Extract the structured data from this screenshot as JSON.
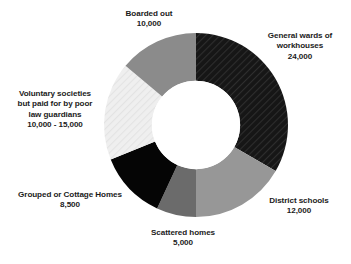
{
  "chart_data": {
    "type": "pie",
    "variant": "donut",
    "title": "",
    "subtitle": "",
    "xlabel": "",
    "ylabel": "",
    "grid": false,
    "legend": "none",
    "labels_position": "outside-callout-text",
    "start_angle_deg": 0,
    "direction": "clockwise",
    "inner_radius_ratio": 0.48,
    "total": 72000,
    "categories": [
      "General wards of workhouses",
      "District schools",
      "Scattered homes",
      "Grouped or Cottage Homes",
      "Voluntary societies but paid for by poor law guardians",
      "Boarded out"
    ],
    "values": [
      24000,
      12000,
      5000,
      8500,
      12500,
      10000
    ],
    "value_labels": [
      "24,000",
      "12,000",
      "5,000",
      "8,500",
      "10,000 - 15,000",
      "10,000"
    ],
    "slices": [
      {
        "name": "General wards of workhouses",
        "value": 24000,
        "value_label": "24,000",
        "angle_deg": 120,
        "start_deg": 0,
        "end_deg": 120,
        "fill": "#1c1c1c",
        "pattern": "diagonal-hatch-dark"
      },
      {
        "name": "District schools",
        "value": 12000,
        "value_label": "12,000",
        "angle_deg": 60,
        "start_deg": 120,
        "end_deg": 180,
        "fill": "#979797",
        "pattern": "solid"
      },
      {
        "name": "Scattered homes",
        "value": 5000,
        "value_label": "5,000",
        "angle_deg": 25,
        "start_deg": 180,
        "end_deg": 205,
        "fill": "#6b6b6b",
        "pattern": "solid"
      },
      {
        "name": "Grouped or Cottage Homes",
        "value": 8500,
        "value_label": "8,500",
        "angle_deg": 43,
        "start_deg": 205,
        "end_deg": 248,
        "fill": "#050505",
        "pattern": "solid"
      },
      {
        "name": "Voluntary societies but paid for by poor law guardians",
        "value": 12500,
        "value_label": "10,000 - 15,000",
        "angle_deg": 62,
        "start_deg": 248,
        "end_deg": 310,
        "fill": "#ededed",
        "pattern": "diagonal-hatch-light"
      },
      {
        "name": "Boarded out",
        "value": 10000,
        "value_label": "10,000",
        "angle_deg": 50,
        "start_deg": 310,
        "end_deg": 360,
        "fill": "#8b8b8b",
        "pattern": "solid"
      }
    ]
  },
  "labels": {
    "general_wards": {
      "line1": "General wards of",
      "line2": "workhouses",
      "value": "24,000"
    },
    "district_schools": {
      "line1": "District schools",
      "value": "12,000"
    },
    "scattered_homes": {
      "line1": "Scattered homes",
      "value": "5,000"
    },
    "grouped_cottage": {
      "line1": "Grouped or Cottage Homes",
      "value": "8,500"
    },
    "voluntary_societies": {
      "line1": "Voluntary societies",
      "line2": "but paid for by poor",
      "line3": "law guardians",
      "value": "10,000 - 15,000"
    },
    "boarded_out": {
      "line1": "Boarded out",
      "value": "10,000"
    }
  },
  "colors": {
    "background": "#ffffff",
    "text": "#1b1b1b",
    "slice_general_wards": "#1c1c1c",
    "slice_district_schools": "#979797",
    "slice_scattered_homes": "#6b6b6b",
    "slice_grouped_cottage": "#050505",
    "slice_voluntary_societies": "#ededed",
    "slice_boarded_out": "#8b8b8b"
  }
}
